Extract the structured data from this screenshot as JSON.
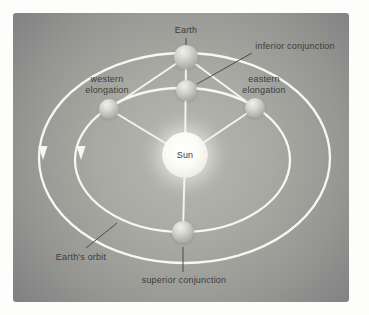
{
  "diagram": {
    "labels": {
      "earth": "Earth",
      "inferior_conjunction": "inferior conjunction",
      "western_line1": "western",
      "western_line2": "elongation",
      "eastern_line1": "eastern",
      "eastern_line2": "elongation",
      "sun": "Sun",
      "earths_orbit": "Earth's orbit",
      "superior_conjunction": "superior conjunction"
    },
    "colors": {
      "page_background": "#ffffff",
      "panel_center": "#b8b8b1",
      "panel_edge": "#7b7b7d",
      "orbit_line": "#f7f7f2",
      "connector_line": "#f4f4ef",
      "pointer_line": "#4a4a4a",
      "label_text": "#3c3c3c",
      "sphere_light": "#f0f0ea",
      "sphere_dark": "#96968e",
      "sun_fill": "#fbfbf6"
    }
  }
}
